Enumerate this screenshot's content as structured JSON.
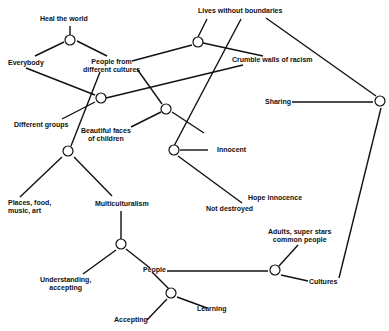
{
  "diagram": {
    "type": "concept-map",
    "nodes": [
      {
        "id": "heal",
        "label": "Heal the world"
      },
      {
        "id": "everybody",
        "label": "Everybody"
      },
      {
        "id": "people_cultures",
        "label": "People from\ndifferent cultures"
      },
      {
        "id": "lives",
        "label": "Lives without boundaries"
      },
      {
        "id": "crumble",
        "label": "Crumble walls of racism"
      },
      {
        "id": "groups",
        "label": "Different groups"
      },
      {
        "id": "faces",
        "label": "Beautiful faces\nof children"
      },
      {
        "id": "sharing",
        "label": "Sharing"
      },
      {
        "id": "innocent",
        "label": "Innocent"
      },
      {
        "id": "places",
        "label": "Places, food,\nmusic, art"
      },
      {
        "id": "multi",
        "label": "Multiculturalism"
      },
      {
        "id": "hope",
        "label": "Hope innocence"
      },
      {
        "id": "destroyed",
        "label": "Not destroyed"
      },
      {
        "id": "adults",
        "label": "Adults, super stars\ncommon people"
      },
      {
        "id": "understanding",
        "label": "Understanding,\naccepting"
      },
      {
        "id": "people",
        "label": "People"
      },
      {
        "id": "cultures",
        "label": "Cultures"
      },
      {
        "id": "learning",
        "label": "Learning"
      },
      {
        "id": "accepting",
        "label": "Accepting"
      }
    ],
    "junctions": [
      {
        "id": "j_heal",
        "connects": [
          "heal",
          "everybody",
          "people_cultures"
        ]
      },
      {
        "id": "j_lives",
        "connects": [
          "lives",
          "people_cultures",
          "crumble"
        ]
      },
      {
        "id": "j_everybody",
        "connects": [
          "everybody",
          "groups",
          "crumble"
        ]
      },
      {
        "id": "j_faces",
        "connects": [
          "people_cultures",
          "faces",
          "innocent"
        ]
      },
      {
        "id": "j_places",
        "connects": [
          "people_cultures",
          "places",
          "multi"
        ]
      },
      {
        "id": "j_innocent",
        "connects": [
          "lives",
          "innocent",
          "hope"
        ]
      },
      {
        "id": "j_sharing",
        "connects": [
          "lives",
          "sharing",
          "cultures"
        ]
      },
      {
        "id": "j_multi",
        "connects": [
          "multi",
          "understanding",
          "people"
        ]
      },
      {
        "id": "j_people",
        "connects": [
          "people",
          "adults",
          "cultures"
        ]
      },
      {
        "id": "j_learning",
        "connects": [
          "people",
          "accepting",
          "learning"
        ]
      }
    ]
  }
}
